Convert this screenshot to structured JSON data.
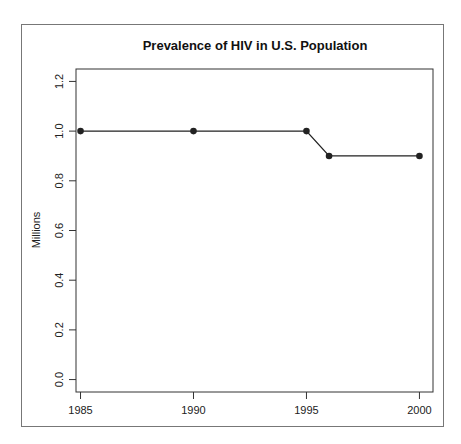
{
  "chart_data": {
    "type": "line",
    "title": "Prevalence of HIV in U.S. Population",
    "xlabel": "",
    "ylabel": "Millions",
    "x": [
      1985,
      1990,
      1995,
      1996,
      2000
    ],
    "series": [
      {
        "name": "HIV prevalence",
        "values": [
          1.0,
          1.0,
          1.0,
          0.9,
          0.9
        ]
      }
    ],
    "xticks": [
      "1985",
      "1990",
      "1995",
      "2000"
    ],
    "yticks": [
      "0.0",
      "0.2",
      "0.4",
      "0.6",
      "0.8",
      "1.0",
      "1.2"
    ],
    "xlim": [
      1984.8,
      2000.6
    ],
    "ylim": [
      -0.05,
      1.25
    ],
    "grid": false,
    "legend": "none",
    "colors": {
      "line": "#222222",
      "points": "#222222"
    }
  }
}
